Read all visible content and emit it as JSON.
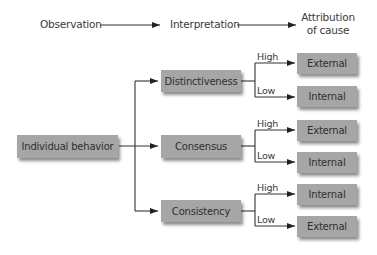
{
  "header": {
    "observation": "Observation",
    "interpretation": "Interpretation",
    "attribution_line1": "Attribution",
    "attribution_line2": "of cause"
  },
  "source": {
    "label": "Individual behavior"
  },
  "factors": [
    {
      "label": "Distinctiveness",
      "branches": [
        {
          "level": "High",
          "result": "External"
        },
        {
          "level": "Low",
          "result": "Internal"
        }
      ]
    },
    {
      "label": "Consensus",
      "branches": [
        {
          "level": "High",
          "result": "External"
        },
        {
          "level": "Low",
          "result": "Internal"
        }
      ]
    },
    {
      "label": "Consistency",
      "branches": [
        {
          "level": "High",
          "result": "Internal"
        },
        {
          "level": "Low",
          "result": "External"
        }
      ]
    }
  ],
  "colors": {
    "box": "#a6a6a6",
    "line": "#333333",
    "text": "#333333"
  }
}
